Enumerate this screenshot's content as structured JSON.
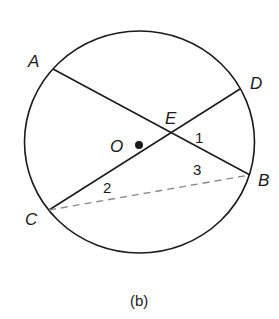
{
  "figure": {
    "caption": "(b)",
    "circle": {
      "cx": 139.5,
      "cy": 142,
      "rx": 115,
      "ry": 111,
      "stroke": "#1a1a1a"
    },
    "center": {
      "label": "O",
      "x": 139,
      "y": 146
    },
    "points": {
      "A": {
        "label": "A",
        "x": 53,
        "y": 69
      },
      "B": {
        "label": "B",
        "x": 250,
        "y": 175
      },
      "C": {
        "label": "C",
        "x": 49,
        "y": 210
      },
      "D": {
        "label": "D",
        "x": 240,
        "y": 89
      },
      "E": {
        "label": "E",
        "x": 171,
        "y": 133
      }
    },
    "segments": [
      {
        "name": "chord-AB",
        "from": "A",
        "to": "B",
        "style": "solid"
      },
      {
        "name": "chord-CD",
        "from": "C",
        "to": "D",
        "style": "solid"
      },
      {
        "name": "segment-CB",
        "from": "C",
        "to": "B",
        "style": "dashed",
        "color": "#8a8a8a"
      }
    ],
    "angle_labels": {
      "angle1": "1",
      "angle2": "2",
      "angle3": "3"
    }
  }
}
